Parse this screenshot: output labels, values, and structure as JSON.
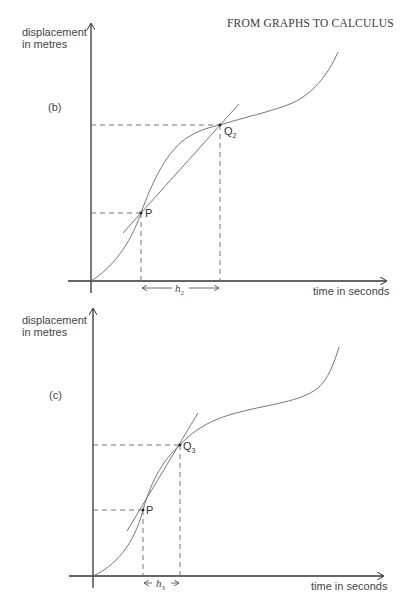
{
  "header": {
    "title": "FROM GRAPHS TO CALCULUS"
  },
  "panels": [
    {
      "id": "b",
      "label": "(b)",
      "y_axis_label_line1": "displacement",
      "y_axis_label_line2": "in metres",
      "x_axis_label": "time in seconds",
      "point_p": {
        "label": "P"
      },
      "point_q": {
        "label": "Q",
        "subscript": "2"
      },
      "interval": {
        "label": "h",
        "subscript": "2"
      }
    },
    {
      "id": "c",
      "label": "(c)",
      "y_axis_label_line1": "displacement",
      "y_axis_label_line2": "in metres",
      "x_axis_label": "time in seconds",
      "point_p": {
        "label": "P"
      },
      "point_q": {
        "label": "Q",
        "subscript": "3"
      },
      "interval": {
        "label": "h",
        "subscript": "3"
      }
    }
  ],
  "colors": {
    "ink": "#444444",
    "curve": "#777777",
    "background": "#ffffff"
  }
}
